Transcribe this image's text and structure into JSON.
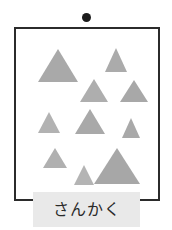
{
  "card": {
    "label": "さんかく",
    "pin_icon": "black-dot-icon",
    "colors": {
      "background": "#ffffff",
      "frame_border": "#2b2b2b",
      "shape_fill": "#ababab",
      "shape_fill_light": "#b5b5b5",
      "label_plate": "#e9e9e9",
      "label_text": "#2a2a2a",
      "pin_dot": "#1c1c1c"
    },
    "frame": {
      "x": 14,
      "y": 27,
      "width": 146,
      "height": 174
    },
    "shape_count": 10,
    "shape_kind": "triangle",
    "shapes": [
      {
        "name": "triangle-1",
        "cx": 42,
        "base_y": 53,
        "half_width": 20,
        "height": 33,
        "fill": "#a9a9a9"
      },
      {
        "name": "triangle-2",
        "cx": 100,
        "base_y": 43,
        "half_width": 11,
        "height": 24,
        "fill": "#ababab"
      },
      {
        "name": "triangle-3",
        "cx": 78,
        "base_y": 73,
        "half_width": 14,
        "height": 23,
        "fill": "#aeaeae"
      },
      {
        "name": "triangle-4",
        "cx": 118,
        "base_y": 73,
        "half_width": 14,
        "height": 22,
        "fill": "#a8a8a8"
      },
      {
        "name": "triangle-5",
        "cx": 33,
        "base_y": 104,
        "half_width": 11,
        "height": 21,
        "fill": "#b2b2b2"
      },
      {
        "name": "triangle-6",
        "cx": 74,
        "base_y": 105,
        "half_width": 15,
        "height": 25,
        "fill": "#a9a9a9"
      },
      {
        "name": "triangle-7",
        "cx": 115,
        "base_y": 109,
        "half_width": 9,
        "height": 20,
        "fill": "#a9a9a9"
      },
      {
        "name": "triangle-8",
        "cx": 39,
        "base_y": 139,
        "half_width": 12,
        "height": 20,
        "fill": "#b0b0b0"
      },
      {
        "name": "triangle-9",
        "cx": 68,
        "base_y": 156,
        "half_width": 10,
        "height": 20,
        "fill": "#b4b4b4"
      },
      {
        "name": "triangle-10",
        "cx": 101,
        "base_y": 155,
        "half_width": 23,
        "height": 36,
        "fill": "#a7a7a7"
      }
    ]
  }
}
